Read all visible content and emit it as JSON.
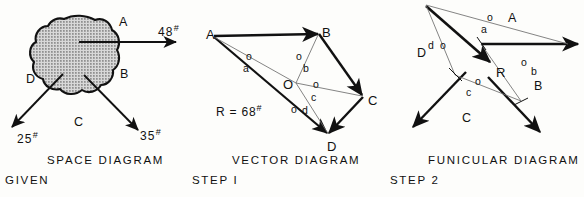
{
  "figure": {
    "ink_color": "#111111",
    "light_line_color": "#6e6e6e",
    "blob_fill": "#c9c9c9",
    "background": "#fdfdfb"
  },
  "space_diagram": {
    "caption": "SPACE  DIAGRAM",
    "step": "GIVEN",
    "space_labels": [
      {
        "text": "A",
        "x": 119,
        "y": 16
      },
      {
        "text": "B",
        "x": 120,
        "y": 68
      },
      {
        "text": "C",
        "x": 74,
        "y": 116
      },
      {
        "text": "D",
        "x": 26,
        "y": 73
      }
    ],
    "forces": [
      {
        "name": "force-48",
        "magnitude": "48",
        "unit": "#",
        "label_x": 158,
        "label_y": 24
      },
      {
        "name": "force-35",
        "magnitude": "35",
        "unit": "#",
        "label_x": 140,
        "label_y": 128
      },
      {
        "name": "force-25",
        "magnitude": "25",
        "unit": "#",
        "label_x": 17,
        "label_y": 131
      }
    ]
  },
  "vector_diagram": {
    "caption": "VECTOR  DIAGRAM",
    "step": "STEP I",
    "resultant": {
      "label": "R = 68",
      "unit": "#",
      "x": 216,
      "y": 104
    },
    "vertices": [
      {
        "text": "A",
        "x": 206,
        "y": 28
      },
      {
        "text": "B",
        "x": 322,
        "y": 26
      },
      {
        "text": "C",
        "x": 368,
        "y": 94
      },
      {
        "text": "D",
        "x": 327,
        "y": 140
      },
      {
        "text": "O",
        "x": 283,
        "y": 78
      }
    ],
    "rays": [
      {
        "o": {
          "x": 246,
          "y": 51
        },
        "letter": {
          "text": "a",
          "x": 243,
          "y": 63
        }
      },
      {
        "o": {
          "x": 296,
          "y": 51
        },
        "letter": {
          "text": "b",
          "x": 303,
          "y": 63
        }
      },
      {
        "o": {
          "x": 313,
          "y": 79
        },
        "letter": {
          "text": "c",
          "x": 311,
          "y": 92
        }
      },
      {
        "o": {
          "x": 291,
          "y": 104
        },
        "letter": {
          "text": "d",
          "x": 302,
          "y": 105
        }
      }
    ]
  },
  "funicular_diagram": {
    "caption": "FUNICULAR  DIAGRAM",
    "step": "STEP 2",
    "resultant_label": {
      "text": "R",
      "x": 496,
      "y": 66
    },
    "space_labels": [
      {
        "text": "A",
        "x": 508,
        "y": 12
      },
      {
        "text": "B",
        "x": 534,
        "y": 80
      },
      {
        "text": "C",
        "x": 462,
        "y": 112
      },
      {
        "text": "D",
        "x": 417,
        "y": 47
      }
    ],
    "rays": [
      {
        "o": {
          "x": 487,
          "y": 12
        },
        "letter": {
          "text": "a",
          "x": 481,
          "y": 24
        }
      },
      {
        "o": {
          "x": 521,
          "y": 57
        },
        "letter": {
          "text": "b",
          "x": 531,
          "y": 66
        }
      },
      {
        "o": {
          "x": 475,
          "y": 76
        },
        "letter": {
          "text": "c",
          "x": 466,
          "y": 87
        }
      },
      {
        "o": {
          "x": 440,
          "y": 40
        },
        "letter": {
          "text": "d",
          "x": 428,
          "y": 40
        }
      }
    ]
  }
}
